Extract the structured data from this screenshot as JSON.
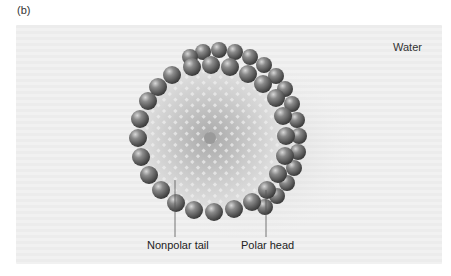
{
  "figure": {
    "panel_label": "(b)",
    "environment_label": "Water",
    "callouts": [
      {
        "label": "Nonpolar tail"
      },
      {
        "label": "Polar head"
      }
    ],
    "structure": "micelle",
    "colors": {
      "background": "#ededed",
      "head": "#5a5a5a",
      "tail_core": "#c8c8c8",
      "text": "#222222"
    }
  }
}
